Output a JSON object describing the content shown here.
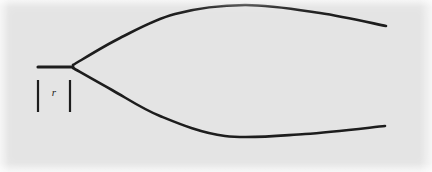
{
  "figure": {
    "kind": "line-drawing",
    "background_color": "#e4e4e4",
    "paper_color": "#f2f2f2",
    "ink_color": "#1d1d1d",
    "canvas": {
      "width": 432,
      "height": 172
    },
    "labels": [
      {
        "name": "radius-label",
        "text": "r",
        "style": "italic",
        "x": 54,
        "y": 96,
        "font_size": 11
      }
    ],
    "dimension_ticks": [
      {
        "name": "left-tick",
        "x": 38,
        "y_top": 80,
        "y_bottom": 112
      },
      {
        "name": "right-tick",
        "x": 70,
        "y_top": 80,
        "y_bottom": 112
      }
    ],
    "strokes": [
      {
        "name": "inlet-stem",
        "type": "line",
        "points": [
          [
            38,
            67
          ],
          [
            73,
            67
          ]
        ],
        "width": 3.1
      },
      {
        "name": "upper-branch",
        "type": "curve",
        "points": [
          [
            73,
            65
          ],
          [
            120,
            38
          ],
          [
            175,
            14
          ],
          [
            245,
            5
          ],
          [
            320,
            13
          ],
          [
            386,
            26
          ]
        ],
        "width": 2.6
      },
      {
        "name": "lower-branch",
        "type": "curve",
        "points": [
          [
            73,
            68
          ],
          [
            112,
            90
          ],
          [
            160,
            116
          ],
          [
            225,
            136
          ],
          [
            305,
            134
          ],
          [
            385,
            126
          ]
        ],
        "width": 2.6
      }
    ]
  }
}
